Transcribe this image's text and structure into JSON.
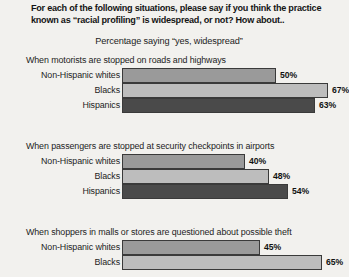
{
  "header": {
    "line1": "For each of the following situations, please say if you think the practice",
    "line2": "known as “racial profiling” is widespread, or not? How about.."
  },
  "subtitle": "Percentage saying “yes, widespread”",
  "chart_data": {
    "type": "bar",
    "orientation": "horizontal",
    "title": "For each of the following situations, please say if you think the practice known as “racial profiling” is widespread, or not? How about..",
    "subtitle": "Percentage saying “yes, widespread”",
    "xlabel": "",
    "ylabel": "",
    "xlim": [
      0,
      70
    ],
    "grid": false,
    "legend": "none",
    "value_suffix": "%",
    "categories": [
      "Non-Hispanic whites",
      "Blacks",
      "Hispanics"
    ],
    "groups": [
      {
        "heading": "When motorists are stopped on roads and highways",
        "values": [
          50,
          67,
          63
        ],
        "labels": [
          "50%",
          "67%",
          "63%"
        ]
      },
      {
        "heading": "When passengers are stopped at security checkpoints in airports",
        "values": [
          40,
          48,
          54
        ],
        "labels": [
          "40%",
          "48%",
          "54%"
        ]
      },
      {
        "heading": "When shoppers in malls or stores are questioned about possible theft",
        "values": [
          45,
          65,
          null
        ],
        "labels": [
          "45%",
          "65%",
          ""
        ],
        "note": "third bar (Hispanics) is cropped off the bottom of the image"
      }
    ]
  }
}
